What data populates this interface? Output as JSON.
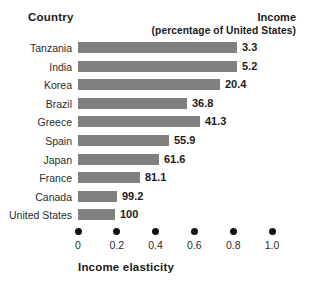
{
  "header": {
    "country_label": "Country",
    "income_label": "Income",
    "income_sublabel": "(percentage of United States)"
  },
  "axis": {
    "title": "Income elasticity",
    "ticks": [
      "0",
      "0.2",
      "0.4",
      "0.6",
      "0.8",
      "1.0"
    ]
  },
  "colors": {
    "bar": "#808080",
    "text": "#1a1a1a",
    "dot": "#111111"
  },
  "chart_data": {
    "type": "bar",
    "orientation": "horizontal",
    "title": "",
    "xlabel": "Income elasticity",
    "ylabel": "Country",
    "xlim": [
      0,
      1.0
    ],
    "grid": false,
    "legend": "none",
    "categories": [
      "Tanzania",
      "India",
      "Korea",
      "Brazil",
      "Greece",
      "Spain",
      "Japan",
      "France",
      "Canada",
      "United States"
    ],
    "values": [
      0.82,
      0.82,
      0.73,
      0.56,
      0.63,
      0.47,
      0.42,
      0.32,
      0.2,
      0.19
    ],
    "data_labels": [
      "3.3",
      "5.2",
      "20.4",
      "36.8",
      "41.3",
      "55.9",
      "61.6",
      "81.1",
      "99.2",
      "100"
    ],
    "data_label_meaning": "Income (percentage of United States)",
    "rows": [
      {
        "country": "Tanzania",
        "income": "3.3",
        "elasticity": 0.82
      },
      {
        "country": "India",
        "income": "5.2",
        "elasticity": 0.82
      },
      {
        "country": "Korea",
        "income": "20.4",
        "elasticity": 0.73
      },
      {
        "country": "Brazil",
        "income": "36.8",
        "elasticity": 0.56
      },
      {
        "country": "Greece",
        "income": "41.3",
        "elasticity": 0.63
      },
      {
        "country": "Spain",
        "income": "55.9",
        "elasticity": 0.47
      },
      {
        "country": "Japan",
        "income": "61.6",
        "elasticity": 0.42
      },
      {
        "country": "France",
        "income": "81.1",
        "elasticity": 0.32
      },
      {
        "country": "Canada",
        "income": "99.2",
        "elasticity": 0.2
      },
      {
        "country": "United States",
        "income": "100",
        "elasticity": 0.19
      }
    ]
  }
}
